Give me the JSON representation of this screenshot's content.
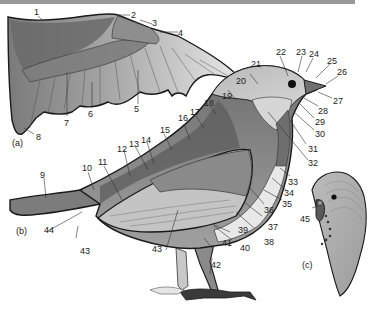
{
  "figure": {
    "panels": [
      {
        "id": "a",
        "label": "(a)",
        "subject": "Spread wing"
      },
      {
        "id": "b",
        "label": "(b)",
        "subject": "Bird body, side view"
      },
      {
        "id": "c",
        "label": "(c)",
        "subject": "Budgerigar head"
      }
    ],
    "callouts": [
      {
        "n": "1"
      },
      {
        "n": "2"
      },
      {
        "n": "3"
      },
      {
        "n": "4"
      },
      {
        "n": "5"
      },
      {
        "n": "6"
      },
      {
        "n": "7"
      },
      {
        "n": "8"
      },
      {
        "n": "9"
      },
      {
        "n": "10"
      },
      {
        "n": "11"
      },
      {
        "n": "12"
      },
      {
        "n": "13"
      },
      {
        "n": "14"
      },
      {
        "n": "15"
      },
      {
        "n": "16"
      },
      {
        "n": "17"
      },
      {
        "n": "18"
      },
      {
        "n": "19"
      },
      {
        "n": "20"
      },
      {
        "n": "21"
      },
      {
        "n": "22"
      },
      {
        "n": "23"
      },
      {
        "n": "24"
      },
      {
        "n": "25"
      },
      {
        "n": "26"
      },
      {
        "n": "27"
      },
      {
        "n": "28"
      },
      {
        "n": "29"
      },
      {
        "n": "30"
      },
      {
        "n": "31"
      },
      {
        "n": "32"
      },
      {
        "n": "33"
      },
      {
        "n": "34"
      },
      {
        "n": "35"
      },
      {
        "n": "36"
      },
      {
        "n": "37"
      },
      {
        "n": "38"
      },
      {
        "n": "39"
      },
      {
        "n": "40"
      },
      {
        "n": "41"
      },
      {
        "n": "42"
      },
      {
        "n": "43"
      },
      {
        "n": "43b",
        "text": "43"
      },
      {
        "n": "44"
      },
      {
        "n": "45"
      }
    ]
  },
  "labels": {
    "c1": "1",
    "c2": "2",
    "c3": "3",
    "c4": "4",
    "c5": "5",
    "c6": "6",
    "c7": "7",
    "c8": "8",
    "c9": "9",
    "c10": "10",
    "c11": "11",
    "c12": "12",
    "c13": "13",
    "c14": "14",
    "c15": "15",
    "c16": "16",
    "c17": "17",
    "c18": "18",
    "c19": "19",
    "c20": "20",
    "c21": "21",
    "c22": "22",
    "c23": "23",
    "c24": "24",
    "c25": "25",
    "c26": "26",
    "c27": "27",
    "c28": "28",
    "c29": "29",
    "c30": "30",
    "c31": "31",
    "c32": "32",
    "c33": "33",
    "c34": "34",
    "c35": "35",
    "c36": "36",
    "c37": "37",
    "c38": "38",
    "c39": "39",
    "c40": "40",
    "c41": "41",
    "c42": "42",
    "c43a": "43",
    "c43b": "43",
    "c44": "44",
    "c45": "45",
    "panel_a": "(a)",
    "panel_b": "(b)",
    "panel_c": "(c)"
  },
  "colors": {
    "outline": "#1a1a1a",
    "feather_dark": "#5a5a5a",
    "feather_mid": "#8c8c8c",
    "feather_light": "#c8c8c8",
    "feather_pale": "#e6e6e6",
    "top_bar": "#9a9a9a"
  }
}
